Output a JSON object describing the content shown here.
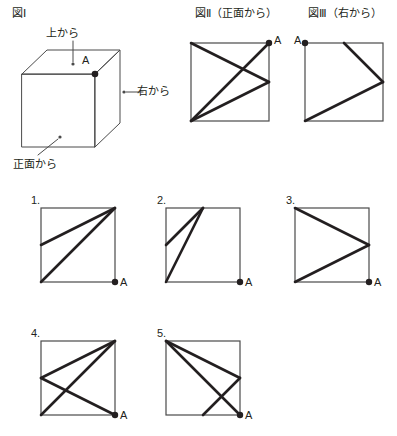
{
  "page": {
    "width": 397,
    "height": 436,
    "background": "#ffffff",
    "ink": "#231f20",
    "thin_stroke": "#4a4a4a"
  },
  "figure1": {
    "title": "図Ⅰ",
    "label_top": "上から",
    "label_right": "右から",
    "label_front": "正面から",
    "vertex_label": "A",
    "description": "cube-with-viewing-directions"
  },
  "figure2": {
    "title": "図Ⅱ（正面から）",
    "vertex_label": "A",
    "square": {
      "x": 191,
      "y": 43,
      "size": 78
    },
    "dot_at": "top-right",
    "lines": [
      {
        "from": "top-left",
        "to": "right-mid"
      },
      {
        "from": "top-right",
        "to": "bottom-left"
      },
      {
        "from": "bottom-left",
        "to": "right-mid"
      }
    ]
  },
  "figure3": {
    "title": "図Ⅲ（右から）",
    "vertex_label": "A",
    "square": {
      "x": 305,
      "y": 43,
      "size": 78
    },
    "dot_at": "top-left",
    "lines": [
      {
        "from": "top-mid",
        "to": "right-mid"
      },
      {
        "from": "right-mid",
        "to": "bottom-left"
      }
    ]
  },
  "options": [
    {
      "number": "1.",
      "vertex_label": "A",
      "square": {
        "x": 41,
        "y": 208,
        "size": 74
      },
      "dot_at": "bottom-right",
      "lines": [
        {
          "from": "top-right",
          "to": "left-mid"
        },
        {
          "from": "top-right",
          "to": "bottom-left"
        }
      ]
    },
    {
      "number": "2.",
      "vertex_label": "A",
      "square": {
        "x": 166,
        "y": 208,
        "size": 74
      },
      "dot_at": "bottom-right",
      "lines": [
        {
          "from": "top-mid",
          "to": "left-mid"
        },
        {
          "from": "top-mid",
          "to": "bottom-left"
        }
      ]
    },
    {
      "number": "3.",
      "vertex_label": "A",
      "square": {
        "x": 295,
        "y": 208,
        "size": 74
      },
      "dot_at": "bottom-right",
      "lines": [
        {
          "from": "top-left",
          "to": "right-mid"
        },
        {
          "from": "right-mid",
          "to": "bottom-left"
        }
      ]
    },
    {
      "number": "4.",
      "vertex_label": "A",
      "square": {
        "x": 41,
        "y": 341,
        "size": 74
      },
      "dot_at": "bottom-right",
      "lines": [
        {
          "from": "top-right",
          "to": "left-mid"
        },
        {
          "from": "left-mid",
          "to": "bottom-right"
        },
        {
          "from": "top-right",
          "to": "bottom-left"
        }
      ]
    },
    {
      "number": "5.",
      "vertex_label": "A",
      "square": {
        "x": 166,
        "y": 341,
        "size": 74
      },
      "dot_at": "bottom-right",
      "lines": [
        {
          "from": "top-left",
          "to": "right-mid"
        },
        {
          "from": "right-mid",
          "to": "bottom-mid"
        },
        {
          "from": "top-left",
          "to": "bottom-right"
        }
      ]
    }
  ]
}
